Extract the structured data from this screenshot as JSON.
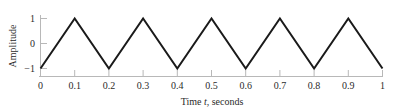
{
  "chart_data": {
    "type": "line",
    "title": "",
    "subtitle": "",
    "xlabel_prefix": "Time ",
    "xlabel_symbol": "t",
    "xlabel_suffix": ", seconds",
    "xlabel_full": "Time t, seconds",
    "ylabel": "Amplitude",
    "xlim": [
      0,
      1
    ],
    "ylim": [
      -1,
      1
    ],
    "grid": false,
    "legend": false,
    "legend_position": "none",
    "waveform": "triangle",
    "period_seconds": 0.2,
    "amplitude": 1,
    "x_ticks": [
      0,
      0.1,
      0.2,
      0.3,
      0.4,
      0.5,
      0.6,
      0.7,
      0.8,
      0.9,
      1
    ],
    "x_tick_labels": [
      "0",
      "0.1",
      "0.2",
      "0.3",
      "0.4",
      "0.5",
      "0.6",
      "0.7",
      "0.8",
      "0.9",
      "1"
    ],
    "y_ticks": [
      -1,
      0,
      1
    ],
    "y_tick_labels": [
      "−1",
      "0",
      "1"
    ],
    "series": [
      {
        "name": "triangle wave",
        "color": "#1a1a1a",
        "x": [
          0,
          0.1,
          0.2,
          0.3,
          0.4,
          0.5,
          0.6,
          0.7,
          0.8,
          0.9,
          1.0
        ],
        "values": [
          -1,
          1,
          -1,
          1,
          -1,
          1,
          -1,
          1,
          -1,
          1,
          -1
        ]
      }
    ],
    "colors": {
      "line": "#1a1a1a",
      "axis": "#b8b8b8",
      "text": "#2b2b2b",
      "background": "#ffffff"
    }
  }
}
